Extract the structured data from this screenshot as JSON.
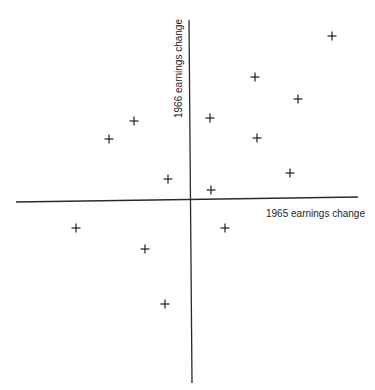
{
  "chart_data": {
    "type": "scatter",
    "title": "",
    "xlabel": "1965 earnings change",
    "ylabel": "1966 earnings change",
    "axes_style": "crosshair through origin",
    "grid": false,
    "legend": null,
    "marker": "plus",
    "units": "relative (no tick labels shown; 1 unit = 10 px)",
    "xlim": [
      -17.5,
      16.7
    ],
    "ylim": [
      -18.3,
      18.0
    ],
    "points": [
      {
        "x": 14.1,
        "y": 16.4
      },
      {
        "x": 6.4,
        "y": 12.3
      },
      {
        "x": 10.7,
        "y": 10.1
      },
      {
        "x": -5.7,
        "y": 7.9
      },
      {
        "x": 1.9,
        "y": 8.2
      },
      {
        "x": -8.2,
        "y": 6.1
      },
      {
        "x": 6.6,
        "y": 6.2
      },
      {
        "x": 9.9,
        "y": 2.7
      },
      {
        "x": -2.3,
        "y": 2.1
      },
      {
        "x": 2.0,
        "y": 1.0
      },
      {
        "x": -11.5,
        "y": -2.8
      },
      {
        "x": 3.4,
        "y": -2.8
      },
      {
        "x": -4.6,
        "y": -4.9
      },
      {
        "x": -2.6,
        "y": -10.4
      }
    ]
  },
  "colors": {
    "ink": "#1e1e1e",
    "background": "#ffffff"
  }
}
